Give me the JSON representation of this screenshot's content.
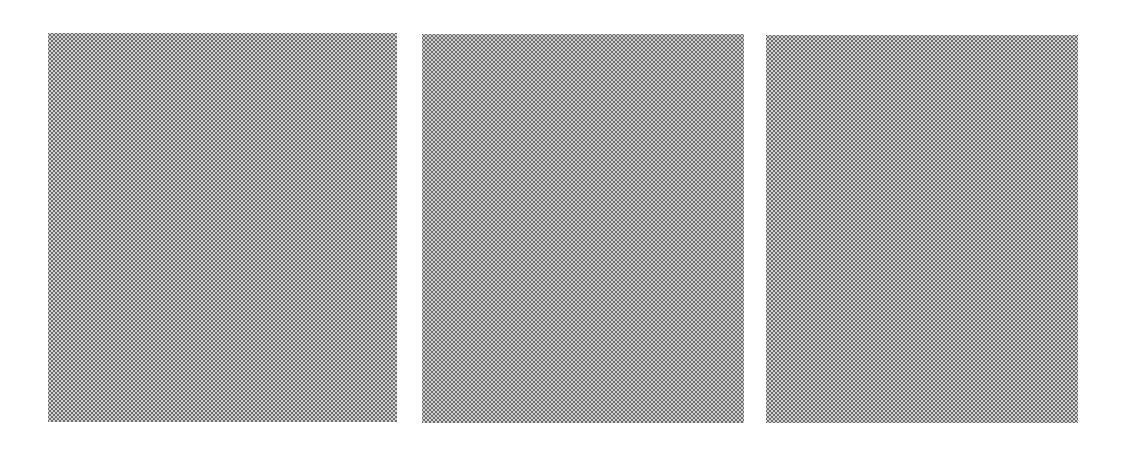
{
  "scene": {
    "description": "Three halftone-dotted gray rectangular panels on a white background",
    "background_color": "#ffffff",
    "panel_fill_color": "#cfcfcf",
    "dot_color": "#6e6e6e",
    "panels": [
      {
        "id": "panel-1",
        "x": 48,
        "y": 33,
        "width": 349,
        "height": 389
      },
      {
        "id": "panel-2",
        "x": 422,
        "y": 34,
        "width": 322,
        "height": 389
      },
      {
        "id": "panel-3",
        "x": 766,
        "y": 35,
        "width": 312,
        "height": 388
      }
    ]
  }
}
